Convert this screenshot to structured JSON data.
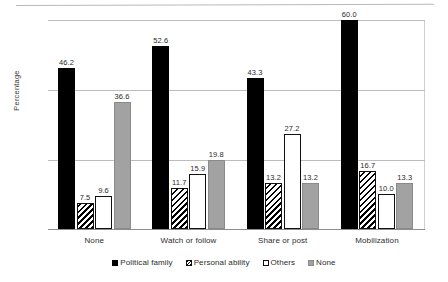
{
  "chart_data": {
    "type": "bar",
    "title": "",
    "xlabel": "",
    "ylabel": "Percentage",
    "ylim": [
      0,
      60
    ],
    "yticks": [
      0,
      20,
      40,
      60
    ],
    "ytick_labels": [
      "0",
      "20",
      "40",
      "60"
    ],
    "grid": true,
    "legend_position": "bottom",
    "categories": [
      "None",
      "Watch or follow",
      "Share or post",
      "Mobilization"
    ],
    "series": [
      {
        "name": "Political family",
        "color": "#000000",
        "pattern": "solid-black",
        "values": [
          46.2,
          52.6,
          43.3,
          60.0
        ],
        "labels": [
          "46.2",
          "52.6",
          "43.3",
          "60.0"
        ]
      },
      {
        "name": "Personal ability",
        "color": "#ffffff",
        "pattern": "diagonal-hatch",
        "values": [
          7.5,
          11.7,
          13.2,
          16.7
        ],
        "labels": [
          "7.5",
          "11.7",
          "13.2",
          "16.7"
        ]
      },
      {
        "name": "Others",
        "color": "#ffffff",
        "pattern": "outline-white",
        "values": [
          9.6,
          15.9,
          27.2,
          10.0
        ],
        "labels": [
          "9.6",
          "15.9",
          "27.2",
          "10.0"
        ]
      },
      {
        "name": "None",
        "color": "#a2a2a2",
        "pattern": "solid-gray",
        "values": [
          36.6,
          19.8,
          13.2,
          13.3
        ],
        "labels": [
          "36.6",
          "19.8",
          "13.2",
          "13.3"
        ]
      }
    ]
  }
}
